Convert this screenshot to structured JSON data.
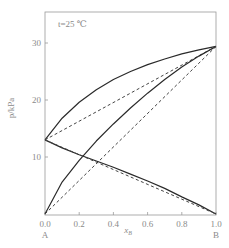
{
  "chart_data": {
    "type": "line",
    "title": "",
    "annotation": "t=25 ℃",
    "xlabel": "x_B",
    "ylabel": "p/kPa",
    "xlim": [
      0.0,
      1.0
    ],
    "ylim": [
      0,
      35
    ],
    "x_ticks": [
      "0.0",
      "0.2",
      "0.4",
      "0.6",
      "0.8",
      "1.0"
    ],
    "y_ticks": [
      "10",
      "20",
      "30"
    ],
    "x_end_labels": {
      "left": "A",
      "right": "B"
    },
    "grid": false,
    "series": [
      {
        "name": "p total (real)",
        "style": "solid",
        "x": [
          0,
          0.1,
          0.2,
          0.3,
          0.4,
          0.5,
          0.6,
          0.7,
          0.8,
          0.9,
          1.0
        ],
        "y": [
          13.0,
          16.8,
          19.6,
          21.8,
          23.6,
          25.0,
          26.2,
          27.2,
          28.1,
          28.8,
          29.4
        ]
      },
      {
        "name": "p total (ideal)",
        "style": "dashed",
        "x": [
          0,
          1.0
        ],
        "y": [
          13.0,
          29.4
        ]
      },
      {
        "name": "p_B (real)",
        "style": "solid",
        "x": [
          0,
          0.1,
          0.2,
          0.3,
          0.4,
          0.5,
          0.6,
          0.7,
          0.8,
          0.9,
          1.0
        ],
        "y": [
          0,
          5.6,
          9.4,
          12.8,
          15.8,
          18.6,
          21.2,
          23.6,
          25.8,
          27.7,
          29.4
        ]
      },
      {
        "name": "p_B (ideal)",
        "style": "dashed",
        "x": [
          0,
          1.0
        ],
        "y": [
          0,
          29.4
        ]
      },
      {
        "name": "p_A (real)",
        "style": "solid",
        "x": [
          0,
          0.1,
          0.2,
          0.3,
          0.4,
          0.5,
          0.6,
          0.7,
          0.8,
          0.9,
          1.0
        ],
        "y": [
          13.0,
          11.6,
          10.4,
          9.3,
          8.2,
          7.0,
          5.8,
          4.5,
          3.0,
          1.6,
          0
        ]
      },
      {
        "name": "p_A (ideal)",
        "style": "dashed",
        "x": [
          0,
          1.0
        ],
        "y": [
          13.0,
          0
        ]
      }
    ]
  },
  "labels": {
    "annotation": "t=25 ℃",
    "ylabel": "p/kPa",
    "xlabel": "x",
    "xlabel_sub": "B",
    "end_left": "A",
    "end_right": "B"
  }
}
